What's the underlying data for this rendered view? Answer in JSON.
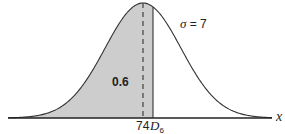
{
  "chart_data": {
    "type": "area",
    "title": "",
    "distribution": {
      "mean": 74,
      "sigma": 7
    },
    "shaded_area": {
      "from": "-inf",
      "to": "D6",
      "value": 0.6
    },
    "annotations": {
      "area_label": "0.6",
      "sigma_label": "σ",
      "sigma_eq": " = 7",
      "mean_tick": "74",
      "d6_tick_main": "D",
      "d6_tick_sub": "6",
      "x_axis_label": "x"
    },
    "xlabel": "x",
    "ylabel": "",
    "mean_line": "dashed",
    "d6_line": "solid",
    "grid": false,
    "colors": {
      "shade": "#c8c8c8",
      "curve": "#333333",
      "axis": "#222222"
    }
  }
}
